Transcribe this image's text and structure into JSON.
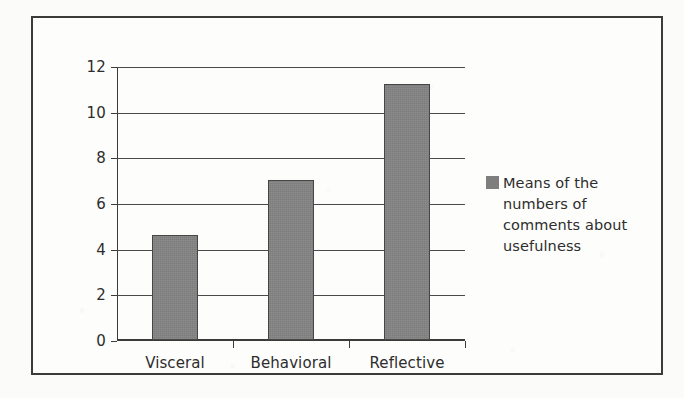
{
  "chart_data": {
    "type": "bar",
    "title": "",
    "xlabel": "",
    "ylabel": "",
    "categories": [
      "Visceral",
      "Behavioral",
      "Reflective"
    ],
    "values": [
      4.6,
      7.0,
      11.2
    ],
    "series": [
      {
        "name": "Means of the numbers of comments about usefulness",
        "values": [
          4.6,
          7.0,
          11.2
        ]
      }
    ],
    "ylim": [
      0,
      12
    ],
    "yticks": [
      0,
      2,
      4,
      6,
      8,
      10,
      12
    ],
    "ytick_labels": [
      "0",
      "2",
      "4",
      "6",
      "8",
      "10",
      "12"
    ],
    "grid": "horizontal",
    "legend_position": "right",
    "bar_color": "#858585",
    "bar_edge_color": "#464646",
    "axis_color": "#3b3b3b",
    "gridline_color": "#4a4a4a",
    "background_color": "#fdfdfc",
    "frame_color": "#3b3b3b"
  },
  "legend": {
    "swatch_color": "#7e7e7e",
    "label": "Means of the numbers of comments about usefulness"
  }
}
